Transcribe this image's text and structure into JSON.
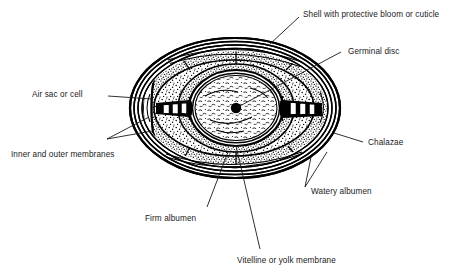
{
  "figure": {
    "ink_color": "#000000",
    "background_color": "#ffffff",
    "text_color": "#1a1a1a"
  },
  "labels": {
    "shell": "Shell with protective bloom or cuticle",
    "germinal_disc": "Germinal disc",
    "air_sac": "Air sac or cell",
    "membranes": "Inner and outer membranes",
    "chalazae": "Chalazae",
    "watery_albumen": "Watery albumen",
    "firm_albumen": "Firm albumen",
    "vitelline": "Vitelline or yolk membrane"
  }
}
